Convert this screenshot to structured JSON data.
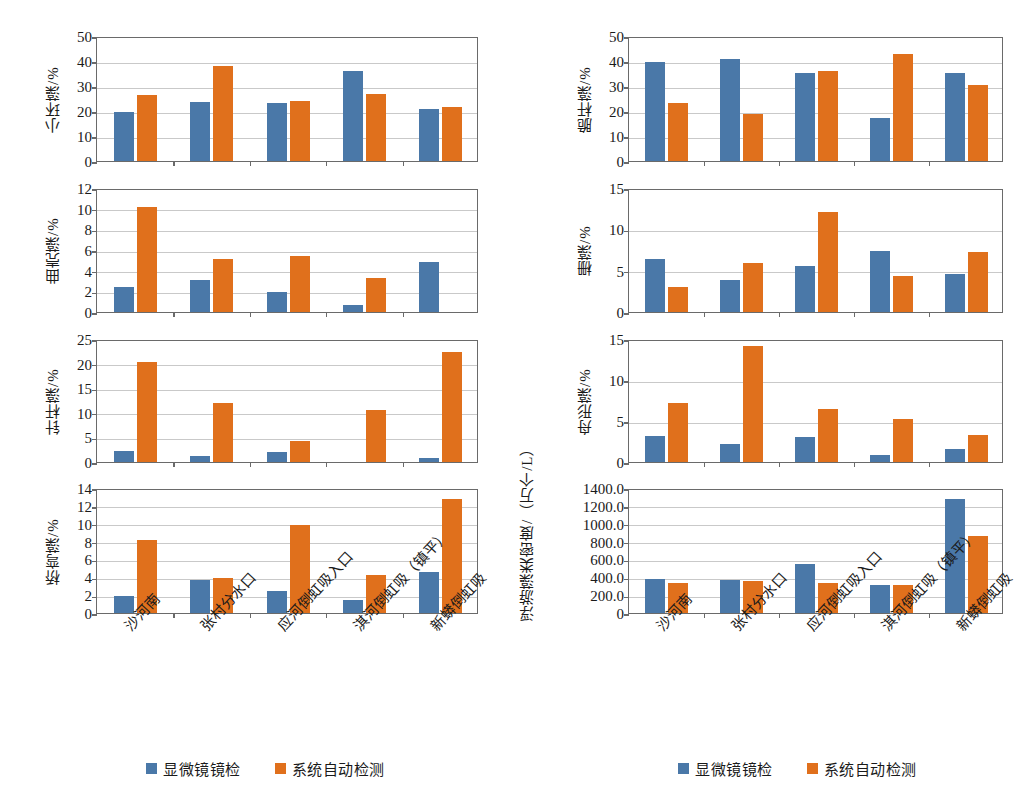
{
  "legend": {
    "series": [
      {
        "name": "显微镜镜检",
        "color": "#4a78a8"
      },
      {
        "name": "系统自动检测",
        "color": "#e0701c"
      }
    ]
  },
  "categories": [
    "沙河南",
    "张村分水口",
    "应河倒虹吸入口",
    "淇河倒虹吸（镇平）",
    "新蟒倒虹吸"
  ],
  "panels": [
    {
      "id": "xiaohuanzao",
      "ylabel": "小环藻/%",
      "ylabel_line2": "",
      "ymax": 50,
      "yticks": [
        "0",
        "10",
        "20",
        "30",
        "40",
        "50"
      ]
    },
    {
      "id": "cuiganzao",
      "ylabel": "脆杆藻/%",
      "ylabel_line2": "",
      "ymax": 50,
      "yticks": [
        "0",
        "10",
        "20",
        "30",
        "40",
        "50"
      ]
    },
    {
      "id": "quqiaozao",
      "ylabel": "曲壳藻/%",
      "ylabel_line2": "",
      "ymax": 12,
      "yticks": [
        "0",
        "2",
        "4",
        "6",
        "8",
        "10",
        "12"
      ]
    },
    {
      "id": "shanzao",
      "ylabel": "栅藻/%",
      "ylabel_line2": "",
      "ymax": 15,
      "yticks": [
        "0",
        "5",
        "10",
        "15"
      ]
    },
    {
      "id": "zhenganzao",
      "ylabel": "针杆藻/%",
      "ylabel_line2": "",
      "ymax": 25,
      "yticks": [
        "0",
        "5",
        "10",
        "15",
        "20",
        "25"
      ]
    },
    {
      "id": "zhouxingzao",
      "ylabel": "舟形藻/%",
      "ylabel_line2": "",
      "ymax": 15,
      "yticks": [
        "0",
        "5",
        "10",
        "15"
      ]
    },
    {
      "id": "qiaowanzao",
      "ylabel": "桥弯藻/%",
      "ylabel_line2": "",
      "ymax": 14,
      "yticks": [
        "0",
        "2",
        "4",
        "6",
        "8",
        "10",
        "12",
        "14"
      ]
    },
    {
      "id": "fuyouzaolei",
      "ylabel": "浮游藻类密度",
      "ylabel_line2": "/（万个/L）",
      "ymax": 1400,
      "yticks": [
        "0",
        "200.0",
        "400.0",
        "600.0",
        "800.0",
        "1000.0",
        "1200.0",
        "1400.0"
      ]
    }
  ],
  "chart_data": [
    {
      "type": "bar",
      "id": "xiaohuanzao",
      "title": "",
      "xlabel": "",
      "ylabel": "小环藻/%",
      "ylim": [
        0,
        50
      ],
      "yticks": [
        0,
        10,
        20,
        30,
        40,
        50
      ],
      "grid": true,
      "legend_position": "bottom",
      "categories": [
        "沙河南",
        "张村分水口",
        "应河倒虹吸入口",
        "淇河倒虹吸（镇平）",
        "新蟒倒虹吸"
      ],
      "series": [
        {
          "name": "显微镜镜检",
          "color": "#4a78a8",
          "values": [
            19.8,
            23.5,
            23.1,
            36.0,
            20.7
          ]
        },
        {
          "name": "系统自动检测",
          "color": "#e0701c",
          "values": [
            26.5,
            38.2,
            23.9,
            26.9,
            21.5
          ]
        }
      ]
    },
    {
      "type": "bar",
      "id": "cuiganzao",
      "title": "",
      "xlabel": "",
      "ylabel": "脆杆藻/%",
      "ylim": [
        0,
        50
      ],
      "yticks": [
        0,
        10,
        20,
        30,
        40,
        50
      ],
      "grid": true,
      "legend_position": "bottom",
      "categories": [
        "沙河南",
        "张村分水口",
        "应河倒虹吸入口",
        "淇河倒虹吸（镇平）",
        "新蟒倒虹吸"
      ],
      "series": [
        {
          "name": "显微镜镜检",
          "color": "#4a78a8",
          "values": [
            39.6,
            40.8,
            35.3,
            17.2,
            35.1
          ]
        },
        {
          "name": "系统自动检测",
          "color": "#e0701c",
          "values": [
            23.3,
            19.0,
            36.0,
            43.0,
            30.3
          ]
        }
      ]
    },
    {
      "type": "bar",
      "id": "quqiaozao",
      "title": "",
      "xlabel": "",
      "ylabel": "曲壳藻/%",
      "ylim": [
        0,
        12
      ],
      "yticks": [
        0,
        2,
        4,
        6,
        8,
        10,
        12
      ],
      "grid": true,
      "legend_position": "bottom",
      "categories": [
        "沙河南",
        "张村分水口",
        "应河倒虹吸入口",
        "淇河倒虹吸（镇平）",
        "新蟒倒虹吸"
      ],
      "series": [
        {
          "name": "显微镜镜检",
          "color": "#4a78a8",
          "values": [
            2.45,
            3.1,
            1.95,
            0.65,
            4.85
          ]
        },
        {
          "name": "系统自动检测",
          "color": "#e0701c",
          "values": [
            10.2,
            5.1,
            5.45,
            3.3,
            0
          ]
        }
      ]
    },
    {
      "type": "bar",
      "id": "shanzao",
      "title": "",
      "xlabel": "",
      "ylabel": "栅藻/%",
      "ylim": [
        0,
        15
      ],
      "yticks": [
        0,
        5,
        10,
        15
      ],
      "grid": true,
      "legend_position": "bottom",
      "categories": [
        "沙河南",
        "张村分水口",
        "应河倒虹吸入口",
        "淇河倒虹吸（镇平）",
        "新蟒倒虹吸"
      ],
      "series": [
        {
          "name": "显微镜镜检",
          "color": "#4a78a8",
          "values": [
            6.4,
            3.85,
            5.55,
            7.4,
            4.6
          ]
        },
        {
          "name": "系统自动检测",
          "color": "#e0701c",
          "values": [
            3.05,
            5.95,
            12.05,
            4.3,
            7.2
          ]
        }
      ]
    },
    {
      "type": "bar",
      "id": "zhenganzao",
      "title": "",
      "xlabel": "",
      "ylabel": "针杆藻/%",
      "ylim": [
        0,
        25
      ],
      "yticks": [
        0,
        5,
        10,
        15,
        20,
        25
      ],
      "grid": true,
      "legend_position": "bottom",
      "categories": [
        "沙河南",
        "张村分水口",
        "应河倒虹吸入口",
        "淇河倒虹吸（镇平）",
        "新蟒倒虹吸"
      ],
      "series": [
        {
          "name": "显微镜镜检",
          "color": "#4a78a8",
          "values": [
            2.2,
            1.3,
            2.1,
            0,
            0.9
          ]
        },
        {
          "name": "系统自动检测",
          "color": "#e0701c",
          "values": [
            20.3,
            11.9,
            4.2,
            10.5,
            22.4
          ]
        }
      ]
    },
    {
      "type": "bar",
      "id": "zhouxingzao",
      "title": "",
      "xlabel": "",
      "ylabel": "舟形藻/%",
      "ylim": [
        0,
        15
      ],
      "yticks": [
        0,
        5,
        10,
        15
      ],
      "grid": true,
      "legend_position": "bottom",
      "categories": [
        "沙河南",
        "张村分水口",
        "应河倒虹吸入口",
        "淇河倒虹吸（镇平）",
        "新蟒倒虹吸"
      ],
      "series": [
        {
          "name": "显微镜镜检",
          "color": "#4a78a8",
          "values": [
            3.2,
            2.2,
            3.1,
            0.85,
            1.6
          ]
        },
        {
          "name": "系统自动检测",
          "color": "#e0701c",
          "values": [
            7.15,
            14.1,
            6.5,
            5.3,
            3.35
          ]
        }
      ]
    },
    {
      "type": "bar",
      "id": "qiaowanzao",
      "title": "",
      "xlabel": "",
      "ylabel": "桥弯藻/%",
      "ylim": [
        0,
        14
      ],
      "yticks": [
        0,
        2,
        4,
        6,
        8,
        10,
        12,
        14
      ],
      "grid": true,
      "legend_position": "bottom",
      "categories": [
        "沙河南",
        "张村分水口",
        "应河倒虹吸入口",
        "淇河倒虹吸（镇平）",
        "新蟒倒虹吸"
      ],
      "series": [
        {
          "name": "显微镜镜检",
          "color": "#4a78a8",
          "values": [
            1.95,
            3.65,
            2.5,
            1.45,
            4.55
          ]
        },
        {
          "name": "系统自动检测",
          "color": "#e0701c",
          "values": [
            8.2,
            3.9,
            9.85,
            4.25,
            12.75
          ]
        }
      ]
    },
    {
      "type": "bar",
      "id": "fuyouzaolei",
      "title": "",
      "xlabel": "",
      "ylabel": "浮游藻类密度/（万个/L）",
      "ylim": [
        0,
        1400
      ],
      "yticks": [
        0,
        200,
        400,
        600,
        800,
        1000,
        1200,
        1400
      ],
      "grid": true,
      "legend_position": "bottom",
      "categories": [
        "沙河南",
        "张村分水口",
        "应河倒虹吸入口",
        "淇河倒虹吸（镇平）",
        "新蟒倒虹吸"
      ],
      "series": [
        {
          "name": "显微镜镜检",
          "color": "#4a78a8",
          "values": [
            380,
            370,
            550,
            310,
            1275
          ]
        },
        {
          "name": "系统自动检测",
          "color": "#e0701c",
          "values": [
            335,
            360,
            340,
            310,
            865
          ]
        }
      ]
    }
  ]
}
